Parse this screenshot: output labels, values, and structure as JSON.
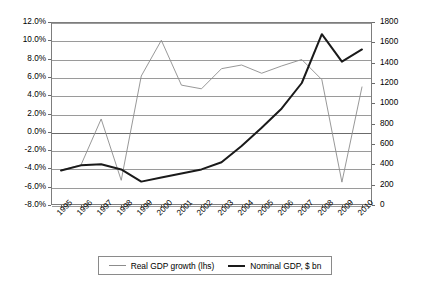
{
  "chart_data": {
    "type": "line",
    "title": "",
    "subtitle": "",
    "xlabel": "",
    "ylabel": "",
    "y2label": "",
    "grid": true,
    "legend_position": "bottom",
    "categories": [
      "1995",
      "1996",
      "1997",
      "1998",
      "1999",
      "2000",
      "2001",
      "2002",
      "2003",
      "2004",
      "2005",
      "2006",
      "2007",
      "2008",
      "2009",
      "2010"
    ],
    "axes": {
      "left": {
        "label": "",
        "ticks": [
          "12.0%",
          "10.0%",
          "8.0%",
          "6.0%",
          "4.0%",
          "2.0%",
          "0.0%",
          "-2.0%",
          "-4.0%",
          "-6.0%",
          "-8.0%"
        ],
        "values": [
          12.0,
          10.0,
          8.0,
          6.0,
          4.0,
          2.0,
          0.0,
          -2.0,
          -4.0,
          -6.0,
          -8.0
        ],
        "min": -8.0,
        "max": 12.0,
        "step": 2.0,
        "unit": "%"
      },
      "right": {
        "label": "",
        "ticks": [
          "1800",
          "1600",
          "1400",
          "1200",
          "1000",
          "800",
          "600",
          "400",
          "200",
          "0"
        ],
        "values": [
          1800,
          1600,
          1400,
          1200,
          1000,
          800,
          600,
          400,
          200,
          0
        ],
        "min": 0,
        "max": 1800,
        "step": 200,
        "unit": "$ bn"
      }
    },
    "series": [
      {
        "name": "Real GDP growth (lhs)",
        "axis": "left",
        "style": "thin",
        "color": "#8c8c8c",
        "values": [
          -4.2,
          -3.6,
          1.4,
          -5.3,
          6.1,
          10.0,
          5.1,
          4.7,
          6.9,
          7.3,
          6.4,
          7.2,
          7.9,
          5.7,
          -5.5,
          4.9
        ]
      },
      {
        "name": "Nominal GDP, $ bn",
        "axis": "right",
        "style": "thick",
        "color": "#1a1a1a",
        "values": [
          340,
          390,
          400,
          350,
          230,
          270,
          310,
          350,
          420,
          580,
          760,
          950,
          1200,
          1680,
          1410,
          1530
        ]
      }
    ]
  },
  "legend": {
    "items": [
      {
        "label": "Real GDP growth (lhs)",
        "style": "thin"
      },
      {
        "label": "Nominal GDP, $ bn",
        "style": "thick"
      }
    ]
  }
}
